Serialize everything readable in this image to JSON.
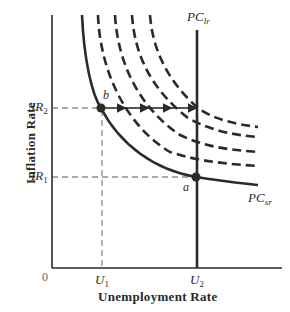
{
  "diagram": {
    "type": "phillips-curve",
    "axes": {
      "x_label": "Unemployment Rate",
      "y_label": "Inflation Rate",
      "origin_label": "0"
    },
    "ticks": {
      "x": [
        {
          "main": "U",
          "sub": "1"
        },
        {
          "main": "U",
          "sub": "2"
        }
      ],
      "y": [
        {
          "main": "IR",
          "sub": "2"
        },
        {
          "main": "IR",
          "sub": "1"
        }
      ]
    },
    "curves": {
      "long_run": {
        "main": "PC",
        "sub": "lr"
      },
      "short_run": {
        "main": "PC",
        "sub": "sr"
      },
      "shifted_short_run_count": 4
    },
    "points": {
      "a": "a",
      "b": "b"
    },
    "colors": {
      "line": "#2a2a2a",
      "background": "#ffffff"
    }
  }
}
